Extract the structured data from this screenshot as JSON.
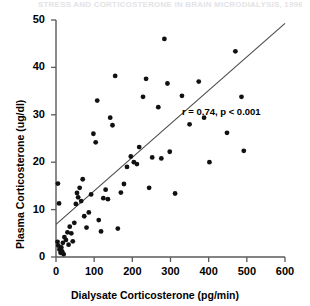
{
  "figure": {
    "faint_header": "STRESS AND CORTICOSTERONE IN BRAIN MICRODIALYSIS, 1996",
    "annotation": "r = 0.74, p < 0.001"
  },
  "chart_data": {
    "type": "scatter",
    "title": "",
    "xlabel": "Dialysate Corticosterone (pg/min)",
    "ylabel": "Plasma Corticosterone (ug/dl)",
    "xlim": [
      0,
      600
    ],
    "ylim": [
      0,
      50
    ],
    "xticks": [
      0,
      100,
      200,
      300,
      400,
      500,
      600
    ],
    "yticks": [
      0,
      10,
      20,
      30,
      40,
      50
    ],
    "grid": false,
    "legend": null,
    "annotations": [
      {
        "text": "r = 0.74, p < 0.001",
        "x": 330,
        "y": 30.5
      }
    ],
    "correlation_r": 0.74,
    "p_value": "<0.001",
    "fit_line": {
      "type": "linear-regression",
      "x_start": 0,
      "y_start": 6.9,
      "x_end": 600,
      "y_end": 49.3
    },
    "points": [
      {
        "x": 5,
        "y": 15.5
      },
      {
        "x": 8,
        "y": 11.3
      },
      {
        "x": 4,
        "y": 3.2
      },
      {
        "x": 6,
        "y": 2.4
      },
      {
        "x": 9,
        "y": 1.6
      },
      {
        "x": 12,
        "y": 0.9
      },
      {
        "x": 14,
        "y": 2.0
      },
      {
        "x": 16,
        "y": 1.2
      },
      {
        "x": 18,
        "y": 3.0
      },
      {
        "x": 20,
        "y": 0.6
      },
      {
        "x": 22,
        "y": 4.2
      },
      {
        "x": 26,
        "y": 3.6
      },
      {
        "x": 30,
        "y": 5.2
      },
      {
        "x": 33,
        "y": 2.6
      },
      {
        "x": 36,
        "y": 6.4
      },
      {
        "x": 40,
        "y": 5.0
      },
      {
        "x": 44,
        "y": 3.3
      },
      {
        "x": 48,
        "y": 7.2
      },
      {
        "x": 52,
        "y": 11.2
      },
      {
        "x": 55,
        "y": 13.5
      },
      {
        "x": 58,
        "y": 12.6
      },
      {
        "x": 62,
        "y": 14.6
      },
      {
        "x": 66,
        "y": 11.8
      },
      {
        "x": 70,
        "y": 16.4
      },
      {
        "x": 74,
        "y": 8.6
      },
      {
        "x": 80,
        "y": 6.2
      },
      {
        "x": 86,
        "y": 9.4
      },
      {
        "x": 92,
        "y": 13.2
      },
      {
        "x": 98,
        "y": 26.0
      },
      {
        "x": 104,
        "y": 24.2
      },
      {
        "x": 108,
        "y": 33.0
      },
      {
        "x": 112,
        "y": 7.8
      },
      {
        "x": 118,
        "y": 5.4
      },
      {
        "x": 124,
        "y": 12.4
      },
      {
        "x": 130,
        "y": 14.2
      },
      {
        "x": 136,
        "y": 12.2
      },
      {
        "x": 142,
        "y": 29.4
      },
      {
        "x": 148,
        "y": 27.8
      },
      {
        "x": 155,
        "y": 38.2
      },
      {
        "x": 162,
        "y": 6.0
      },
      {
        "x": 170,
        "y": 13.6
      },
      {
        "x": 178,
        "y": 15.4
      },
      {
        "x": 186,
        "y": 19.0
      },
      {
        "x": 196,
        "y": 21.2
      },
      {
        "x": 204,
        "y": 20.0
      },
      {
        "x": 212,
        "y": 19.6
      },
      {
        "x": 218,
        "y": 23.2
      },
      {
        "x": 228,
        "y": 33.8
      },
      {
        "x": 236,
        "y": 37.6
      },
      {
        "x": 244,
        "y": 14.6
      },
      {
        "x": 252,
        "y": 21.0
      },
      {
        "x": 268,
        "y": 31.6
      },
      {
        "x": 276,
        "y": 20.8
      },
      {
        "x": 284,
        "y": 46.0
      },
      {
        "x": 292,
        "y": 36.6
      },
      {
        "x": 298,
        "y": 22.2
      },
      {
        "x": 312,
        "y": 13.4
      },
      {
        "x": 330,
        "y": 34.0
      },
      {
        "x": 350,
        "y": 28.0
      },
      {
        "x": 374,
        "y": 37.0
      },
      {
        "x": 388,
        "y": 29.4
      },
      {
        "x": 402,
        "y": 20.0
      },
      {
        "x": 448,
        "y": 26.2
      },
      {
        "x": 470,
        "y": 43.4
      },
      {
        "x": 486,
        "y": 33.8
      },
      {
        "x": 492,
        "y": 22.4
      }
    ]
  }
}
